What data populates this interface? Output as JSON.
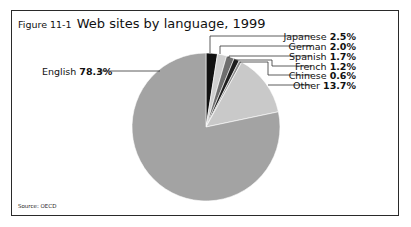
{
  "figure": {
    "number": "Figure 11-1",
    "title": "Web sites by language, 1999",
    "source": "Source: OECD"
  },
  "labels": {
    "japanese": {
      "name": "Japanese",
      "value": "2.5%"
    },
    "german": {
      "name": "German",
      "value": "2.0%"
    },
    "spanish": {
      "name": "Spanish",
      "value": "1.7%"
    },
    "french": {
      "name": "French",
      "value": "1.2%"
    },
    "chinese": {
      "name": "Chinese",
      "value": "0.6%"
    },
    "other": {
      "name": "Other",
      "value": "13.7%"
    },
    "english": {
      "name": "English",
      "value": "78.3%"
    }
  },
  "colors": {
    "japanese": "#111111",
    "german": "#cfcfcf",
    "spanish": "#6e6e6e",
    "french": "#1e1e1e",
    "chinese": "#8a8a8a",
    "other": "#c9c9c9",
    "english": "#a3a3a3",
    "frame": "#2a2a2a"
  },
  "chart_data": {
    "type": "pie",
    "title": "Figure 11-1 Web sites by language, 1999",
    "categories": [
      "Japanese",
      "German",
      "Spanish",
      "French",
      "Chinese",
      "Other",
      "English"
    ],
    "values": [
      2.5,
      2.0,
      1.7,
      1.2,
      0.6,
      13.7,
      78.3
    ],
    "unit": "%",
    "start_angle": "12 o'clock, clockwise",
    "annotation": "Source: OECD",
    "legend": "none (leader-line labels)"
  }
}
